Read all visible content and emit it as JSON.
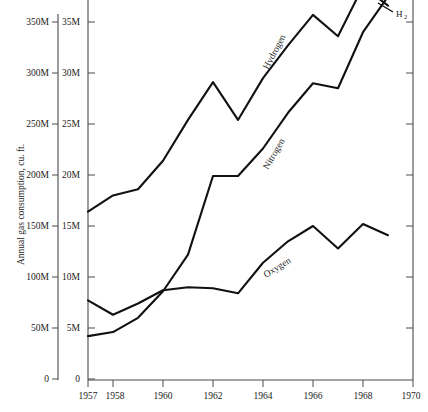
{
  "chart_data": {
    "type": "line",
    "title": "",
    "xlabel": "",
    "ylabel": "Annual gas consumption, cu. ft.",
    "x": [
      1957,
      1958,
      1959,
      1960,
      1961,
      1962,
      1963,
      1964,
      1965,
      1966,
      1967,
      1968,
      1969
    ],
    "xlim": [
      1957,
      1970
    ],
    "xticks": [
      1957,
      1958,
      1960,
      1962,
      1964,
      1966,
      1968,
      1970
    ],
    "xtick_labels": [
      "1957",
      "1958",
      "1960",
      "1962",
      "1964",
      "1966",
      "1968",
      "1970"
    ],
    "ylim": [
      0,
      35
    ],
    "yticks_right": [
      0,
      5,
      10,
      15,
      20,
      25,
      30,
      35
    ],
    "ytick_labels_right": [
      "0",
      "5M",
      "10M",
      "15M",
      "20M",
      "25M",
      "30M",
      "35M"
    ],
    "ytick_labels_left": [
      "0",
      "50M",
      "100M",
      "150M",
      "200M",
      "250M",
      "300M",
      "350M"
    ],
    "grid": false,
    "legend": "inline-rotated-labels",
    "series": [
      {
        "name": "Hydrogen",
        "label": "Hydrogen",
        "annotation": "H",
        "annotation_sub": "2",
        "color": "#111111",
        "scale_note": "read on left axis, 10x right axis",
        "values": [
          16.4,
          18.0,
          18.6,
          21.4,
          25.4,
          29.1,
          25.4,
          29.5,
          32.7,
          35.7,
          33.6,
          38.5,
          36.6
        ]
      },
      {
        "name": "Nitrogen",
        "label": "Nitrogen",
        "color": "#111111",
        "values": [
          4.2,
          4.6,
          6.0,
          8.6,
          12.2,
          19.9,
          19.9,
          22.6,
          26.1,
          29.0,
          28.5,
          34.0,
          37.5
        ]
      },
      {
        "name": "Oxygen",
        "label": "Oxygen",
        "color": "#111111",
        "values": [
          7.7,
          6.3,
          7.4,
          8.7,
          9.0,
          8.9,
          8.4,
          11.4,
          13.5,
          15.0,
          12.8,
          15.2,
          14.1
        ]
      }
    ]
  },
  "axes": {
    "left_axis_name": "left-value-axis",
    "right_axis_name": "right-value-axis",
    "bottom_axis_name": "year-axis"
  }
}
